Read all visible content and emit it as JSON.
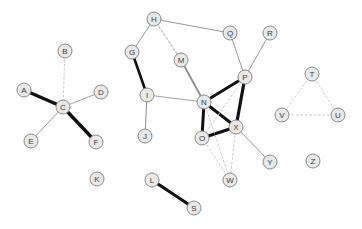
{
  "graph": {
    "title": "Undirected node-link network graph",
    "type": "node-link-diagram",
    "node_count": 26,
    "edge_count": 29,
    "style": {
      "node_fill": "#e8e8e8",
      "node_stroke": "#8a8a8a",
      "node_radius": 7,
      "label_color": "#3c3c3c",
      "background": "#ffffff",
      "edge_strong_color": "#111111",
      "edge_medium_color": "#8c8c8c",
      "edge_dashed_color": "#c8c8c8"
    },
    "nodes": [
      {
        "id": "A",
        "label": "A",
        "x": 24,
        "y": 90,
        "degree": 1
      },
      {
        "id": "B",
        "label": "B",
        "x": 65,
        "y": 51,
        "degree": 1
      },
      {
        "id": "C",
        "label": "C",
        "x": 63,
        "y": 107,
        "degree": 5
      },
      {
        "id": "D",
        "label": "D",
        "x": 101,
        "y": 92,
        "degree": 1
      },
      {
        "id": "E",
        "label": "E",
        "x": 31,
        "y": 141,
        "degree": 1
      },
      {
        "id": "F",
        "label": "F",
        "x": 96,
        "y": 142,
        "degree": 1
      },
      {
        "id": "G",
        "label": "G",
        "x": 132,
        "y": 52,
        "degree": 2
      },
      {
        "id": "H",
        "label": "H",
        "x": 154,
        "y": 19,
        "degree": 3
      },
      {
        "id": "I",
        "label": "I",
        "x": 147,
        "y": 95,
        "degree": 3
      },
      {
        "id": "J",
        "label": "J",
        "x": 145,
        "y": 136,
        "degree": 1
      },
      {
        "id": "K",
        "label": "K",
        "x": 97,
        "y": 179,
        "degree": 0
      },
      {
        "id": "L",
        "label": "L",
        "x": 152,
        "y": 180,
        "degree": 1
      },
      {
        "id": "M",
        "label": "M",
        "x": 181,
        "y": 60,
        "degree": 2
      },
      {
        "id": "N",
        "label": "N",
        "x": 204,
        "y": 102,
        "degree": 6
      },
      {
        "id": "O",
        "label": "O",
        "x": 202,
        "y": 138,
        "degree": 4
      },
      {
        "id": "P",
        "label": "P",
        "x": 245,
        "y": 77,
        "degree": 5
      },
      {
        "id": "Q",
        "label": "Q",
        "x": 230,
        "y": 33,
        "degree": 2
      },
      {
        "id": "R",
        "label": "R",
        "x": 270,
        "y": 33,
        "degree": 1
      },
      {
        "id": "S",
        "label": "S",
        "x": 194,
        "y": 208,
        "degree": 1
      },
      {
        "id": "T",
        "label": "T",
        "x": 312,
        "y": 74,
        "degree": 2
      },
      {
        "id": "U",
        "label": "U",
        "x": 338,
        "y": 115,
        "degree": 2
      },
      {
        "id": "V",
        "label": "V",
        "x": 282,
        "y": 115,
        "degree": 2
      },
      {
        "id": "W",
        "label": "W",
        "x": 230,
        "y": 180,
        "degree": 3
      },
      {
        "id": "X",
        "label": "X",
        "x": 236,
        "y": 127,
        "degree": 5
      },
      {
        "id": "Y",
        "label": "Y",
        "x": 270,
        "y": 162,
        "degree": 1
      },
      {
        "id": "Z",
        "label": "Z",
        "x": 313,
        "y": 161,
        "degree": 0
      }
    ],
    "edges": [
      {
        "source": "A",
        "target": "C",
        "weight": "strong",
        "style": "solid",
        "width": 3.4
      },
      {
        "source": "C",
        "target": "F",
        "weight": "strong",
        "style": "solid",
        "width": 3.4
      },
      {
        "source": "C",
        "target": "D",
        "weight": "weak",
        "style": "solid",
        "width": 0.8
      },
      {
        "source": "C",
        "target": "E",
        "weight": "weak",
        "style": "solid",
        "width": 0.9
      },
      {
        "source": "B",
        "target": "C",
        "weight": "faint",
        "style": "dashed",
        "width": 0.9
      },
      {
        "source": "G",
        "target": "H",
        "weight": "weak",
        "style": "solid",
        "width": 0.9
      },
      {
        "source": "G",
        "target": "I",
        "weight": "strong",
        "style": "solid",
        "width": 2.6
      },
      {
        "source": "H",
        "target": "Q",
        "weight": "weak",
        "style": "solid",
        "width": 0.9
      },
      {
        "source": "H",
        "target": "M",
        "weight": "faint",
        "style": "dashed",
        "width": 1.4
      },
      {
        "source": "Q",
        "target": "P",
        "weight": "weak",
        "style": "solid",
        "width": 0.9
      },
      {
        "source": "R",
        "target": "P",
        "weight": "weak",
        "style": "solid",
        "width": 0.9
      },
      {
        "source": "I",
        "target": "J",
        "weight": "weak",
        "style": "solid",
        "width": 1.0
      },
      {
        "source": "I",
        "target": "N",
        "weight": "weak",
        "style": "solid",
        "width": 0.8
      },
      {
        "source": "M",
        "target": "N",
        "weight": "medium",
        "style": "solid",
        "width": 1.8
      },
      {
        "source": "N",
        "target": "O",
        "weight": "strong",
        "style": "solid",
        "width": 3.0
      },
      {
        "source": "N",
        "target": "P",
        "weight": "strong",
        "style": "solid",
        "width": 2.8
      },
      {
        "source": "N",
        "target": "X",
        "weight": "strong",
        "style": "solid",
        "width": 3.0
      },
      {
        "source": "O",
        "target": "X",
        "weight": "strong",
        "style": "solid",
        "width": 3.0
      },
      {
        "source": "P",
        "target": "X",
        "weight": "strong",
        "style": "solid",
        "width": 3.2
      },
      {
        "source": "P",
        "target": "O",
        "weight": "faint",
        "style": "dashed",
        "width": 0.9
      },
      {
        "source": "N",
        "target": "W",
        "weight": "faint",
        "style": "dashed",
        "width": 0.9
      },
      {
        "source": "O",
        "target": "W",
        "weight": "faint",
        "style": "dashed",
        "width": 0.9
      },
      {
        "source": "X",
        "target": "W",
        "weight": "faint",
        "style": "dashed",
        "width": 0.9
      },
      {
        "source": "X",
        "target": "Y",
        "weight": "weak",
        "style": "solid",
        "width": 0.9
      },
      {
        "source": "L",
        "target": "S",
        "weight": "strong",
        "style": "solid",
        "width": 3.2
      },
      {
        "source": "T",
        "target": "U",
        "weight": "faint",
        "style": "dashed",
        "width": 0.9
      },
      {
        "source": "T",
        "target": "V",
        "weight": "faint",
        "style": "dashed",
        "width": 0.9
      },
      {
        "source": "U",
        "target": "V",
        "weight": "faint",
        "style": "dashed",
        "width": 0.9
      }
    ]
  }
}
